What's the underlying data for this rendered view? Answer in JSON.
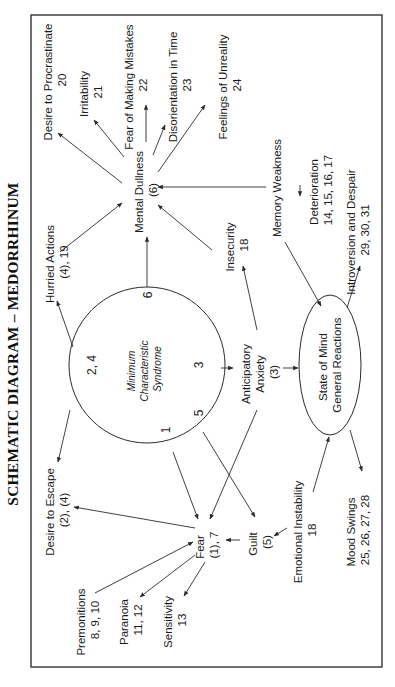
{
  "title": "SCHEMATIC DIAGRAM – MEDORRHINUM",
  "center": {
    "label_lines": [
      "Minimum",
      "Characteristic",
      "Syndrome"
    ],
    "markers": {
      "m24": "2,  4",
      "m6": "6",
      "m3": "3",
      "m5": "5",
      "m1": "1"
    }
  },
  "nodes": {
    "mental_dullness": [
      "Mental Dullness",
      "(6)"
    ],
    "procrastinate": [
      "Desire to Procrastinate",
      "20"
    ],
    "irritability": [
      "Irritability",
      "21"
    ],
    "fear_mistakes": [
      "Fear of Making Mistakes",
      "22"
    ],
    "disorientation": [
      "Disorientation in Time",
      "23"
    ],
    "unreality": [
      "Feelings of Unreality",
      "24"
    ],
    "memory_weakness": [
      "Memory Weakness"
    ],
    "deterioration": [
      "Deterioration",
      "14, 15, 16, 17"
    ],
    "introversion": [
      "Introversion and Despair",
      "29, 30, 31"
    ],
    "hurried_actions": [
      "Hurried Actions",
      "(4), 19"
    ],
    "insecurity": [
      "Insecurity",
      "18"
    ],
    "anticipatory_anxiety": [
      "Anticipatory",
      "Anxiety",
      "(3)"
    ],
    "state_of_mind": [
      "State of Mind",
      "General Reactions"
    ],
    "desire_escape": [
      "Desire to Escape",
      "(2), (4)"
    ],
    "fear": [
      "Fear",
      "(1), 7"
    ],
    "guilt": [
      "Guilt",
      "(5)"
    ],
    "emotional_instability": [
      "Emotional Instability",
      "18"
    ],
    "mood_swings": [
      "Mood Swings",
      "25, 26, 27, 28"
    ],
    "premonitions": [
      "Premonitions",
      "8, 9, 10"
    ],
    "paranoia": [
      "Paranoia",
      "11, 12"
    ],
    "sensitivity": [
      "Sensitivity",
      "13"
    ]
  },
  "edges": [
    {
      "from": "Mental Dullness",
      "to": "Desire to Procrastinate"
    },
    {
      "from": "Mental Dullness",
      "to": "Irritability"
    },
    {
      "from": "Mental Dullness",
      "to": "Fear of Making Mistakes"
    },
    {
      "from": "Mental Dullness",
      "to": "Disorientation in Time"
    },
    {
      "from": "Mental Dullness",
      "to": "Feelings of Unreality"
    },
    {
      "from": "Memory Weakness",
      "to": "Mental Dullness"
    },
    {
      "from": "Memory Weakness",
      "to": "Deterioration"
    },
    {
      "from": "Hurried Actions",
      "to": "Mental Dullness"
    },
    {
      "from": "Insecurity",
      "to": "Mental Dullness"
    },
    {
      "from": "Minimum Characteristic Syndrome (6)",
      "to": "Mental Dullness"
    },
    {
      "from": "Minimum Characteristic Syndrome (2, 4)",
      "to": "Hurried Actions"
    },
    {
      "from": "Anticipatory Anxiety",
      "to": "Insecurity"
    },
    {
      "from": "Minimum Characteristic Syndrome (3)",
      "to": "Anticipatory Anxiety"
    },
    {
      "from": "Anticipatory Anxiety",
      "to": "State of Mind General Reactions"
    },
    {
      "from": "Memory Weakness",
      "to": "State of Mind General Reactions"
    },
    {
      "from": "State of Mind General Reactions",
      "to": "Introversion and Despair"
    },
    {
      "from": "Minimum Characteristic Syndrome (2, 4)",
      "to": "Desire to Escape"
    },
    {
      "from": "Fear",
      "to": "Desire to Escape"
    },
    {
      "from": "Minimum Characteristic Syndrome (1)",
      "to": "Fear"
    },
    {
      "from": "Minimum Characteristic Syndrome (5)",
      "to": "Guilt"
    },
    {
      "from": "Anticipatory Anxiety",
      "to": "Fear"
    },
    {
      "from": "Guilt",
      "to": "Fear"
    },
    {
      "from": "Emotional Instability",
      "to": "Guilt"
    },
    {
      "from": "Emotional Instability",
      "to": "State of Mind General Reactions"
    },
    {
      "from": "State of Mind General Reactions",
      "to": "Mood Swings"
    },
    {
      "from": "Premonitions",
      "to": "Fear"
    },
    {
      "from": "Fear",
      "to": "Paranoia"
    },
    {
      "from": "Fear",
      "to": "Sensitivity"
    }
  ]
}
